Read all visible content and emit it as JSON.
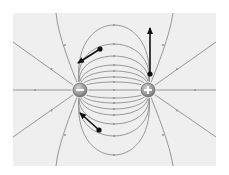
{
  "diagram": {
    "title": "Electric dipole field lines",
    "description": "Electric field lines between a negative charge (left) and a positive charge (right), with three force/field vectors drawn at test points",
    "colors": {
      "page_background": "#ffffff",
      "panel_background": "#efefef",
      "field_line": "#8c8c8c",
      "arrow": "#111111",
      "charge_fill": "#9a9a9a",
      "charge_rim": "#6e6e6e",
      "charge_symbol": "#ffffff"
    },
    "panel": {
      "x": 13,
      "y": 13,
      "width": 203,
      "height": 153
    },
    "charges": [
      {
        "id": "negative",
        "sign": "-",
        "label": "negative charge",
        "x": 80,
        "y": 90,
        "r": 7
      },
      {
        "id": "positive",
        "sign": "+",
        "label": "positive charge",
        "x": 148,
        "y": 90,
        "r": 7
      }
    ],
    "inner_field_line_offsets": [
      8,
      13,
      19,
      25,
      34,
      46,
      65
    ],
    "vectors": [
      {
        "id": "upper-left",
        "from": [
          100,
          49
        ],
        "to": [
          78,
          63
        ]
      },
      {
        "id": "upper-right",
        "from": [
          150,
          74
        ],
        "to": [
          150,
          28
        ]
      },
      {
        "id": "lower-left",
        "from": [
          99,
          130
        ],
        "to": [
          80,
          113
        ]
      }
    ]
  }
}
